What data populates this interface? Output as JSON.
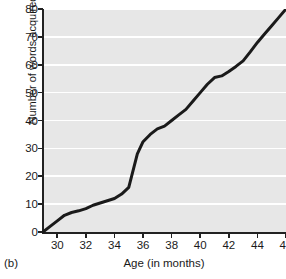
{
  "panel": {
    "letter": "(b)"
  },
  "colors": {
    "plot_background": "#e7e7e7",
    "gridline": "#ffffff",
    "axis": "#222222",
    "line": "#1a1a1a",
    "text": "#1a1a1a",
    "page_background": "#ffffff"
  },
  "chart_data": {
    "type": "line",
    "title": "",
    "subtitle": "",
    "xlabel": "Age (in months)",
    "ylabel": "Number of words acquired",
    "xlim": [
      29,
      46
    ],
    "ylim": [
      0,
      80
    ],
    "xticks": [
      30,
      32,
      34,
      36,
      38,
      40,
      42,
      44,
      46
    ],
    "xtick_labels": [
      "30",
      "32",
      "34",
      "36",
      "38",
      "40",
      "42",
      "44",
      "46"
    ],
    "yticks": [
      0,
      10,
      20,
      30,
      40,
      50,
      60,
      70,
      80
    ],
    "ytick_labels": [
      "0",
      "10",
      "20",
      "30",
      "40",
      "50",
      "60",
      "70",
      "80"
    ],
    "grid": "horizontal",
    "legend": null,
    "legend_position": "none",
    "annotations": [],
    "series": [
      {
        "name": "Words acquired",
        "color": "#1a1a1a",
        "x": [
          29.0,
          29.5,
          30.0,
          30.5,
          31.0,
          31.5,
          32.0,
          32.5,
          33.0,
          33.5,
          34.0,
          34.5,
          35.0,
          35.3,
          35.6,
          36.0,
          36.5,
          37.0,
          37.5,
          38.0,
          38.5,
          39.0,
          39.5,
          40.0,
          40.5,
          41.0,
          41.5,
          42.0,
          42.5,
          43.0,
          43.5,
          44.0,
          44.5,
          45.0,
          45.5,
          46.0
        ],
        "y": [
          0,
          2,
          4,
          6,
          7,
          7.6,
          8.4,
          9.6,
          10.4,
          11.2,
          12,
          13.6,
          16,
          22,
          28,
          32.4,
          35,
          37,
          38,
          40,
          42,
          44,
          47,
          50,
          53,
          55.4,
          56,
          57.6,
          59.4,
          61.4,
          64.6,
          68,
          71,
          74,
          77,
          80
        ]
      }
    ]
  }
}
